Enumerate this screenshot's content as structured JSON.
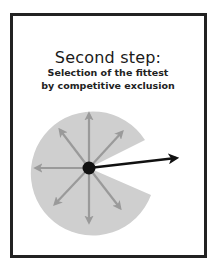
{
  "figure": {
    "title": "Second step:",
    "subtitle_line1": "Selection of the fittest",
    "subtitle_line2": "by competitive exclusion"
  },
  "diagram": {
    "pie_color": "#cfcfcf",
    "gray_arrow_color": "#9a9a9a",
    "black_arrow_color": "#111111",
    "frame_color": "#222222",
    "gray_arrow_directions": [
      "up",
      "up-left",
      "up-right",
      "left",
      "down-left",
      "down",
      "down-right"
    ],
    "highlighted_arrow_direction": "right"
  }
}
